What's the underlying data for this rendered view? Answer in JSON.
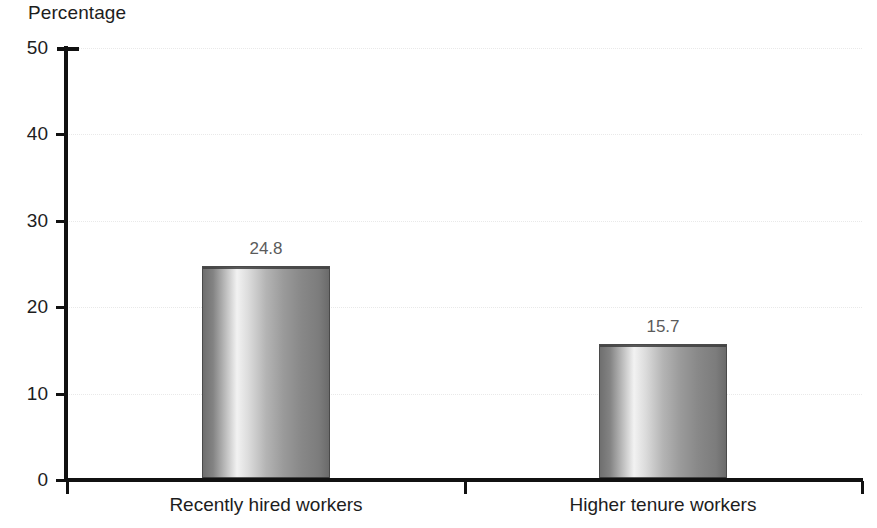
{
  "chart_data": {
    "type": "bar",
    "title": "Percentage",
    "xlabel": "",
    "ylabel": "Percentage",
    "categories": [
      "Recently hired workers",
      "Higher tenure workers"
    ],
    "values": [
      24.8,
      15.7
    ],
    "data_labels": [
      "24.8",
      "15.7"
    ],
    "ylim": [
      0,
      50
    ],
    "yticks": [
      0,
      10,
      20,
      30,
      40,
      50
    ],
    "ytick_labels": [
      "0",
      "10",
      "20",
      "30",
      "40",
      "50"
    ],
    "grid": "horizontal-dotted-light",
    "legend": "none",
    "series": [
      {
        "name": "Percentage",
        "values": [
          24.8,
          15.7
        ]
      }
    ],
    "colors": {
      "bar_light": "#f2f2f2",
      "bar_mid": "#b4b4b4",
      "bar_dark": "#6b6b6b",
      "axis": "#111111",
      "grid": "#e9e9e9",
      "text": "#1d1d1d",
      "value_label": "#5b5b5b"
    }
  },
  "axis": {
    "y_title": "Percentage"
  }
}
